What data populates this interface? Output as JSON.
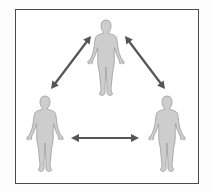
{
  "diagram": {
    "type": "relationship-triangle",
    "colors": {
      "frame_border": "#4a4a4a",
      "figure_fill": "#cdcdcd",
      "figure_outline": "#9a9a9a",
      "arrow": "#555555",
      "background": "#ffffff"
    },
    "nodes": [
      {
        "id": "person-top",
        "label": "",
        "cx": 106,
        "top": 20,
        "bottom": 96
      },
      {
        "id": "person-left",
        "label": "",
        "cx": 45,
        "top": 96,
        "bottom": 172
      },
      {
        "id": "person-right",
        "label": "",
        "cx": 167,
        "top": 96,
        "bottom": 172
      }
    ],
    "edges": [
      {
        "from": "person-top",
        "to": "person-left",
        "direction": "bidirectional",
        "x1": 91,
        "y1": 36,
        "x2": 51,
        "y2": 89
      },
      {
        "from": "person-top",
        "to": "person-right",
        "direction": "bidirectional",
        "x1": 125,
        "y1": 36,
        "x2": 165,
        "y2": 89
      },
      {
        "from": "person-left",
        "to": "person-right",
        "direction": "bidirectional",
        "x1": 71,
        "y1": 138,
        "x2": 139,
        "y2": 138
      }
    ]
  }
}
